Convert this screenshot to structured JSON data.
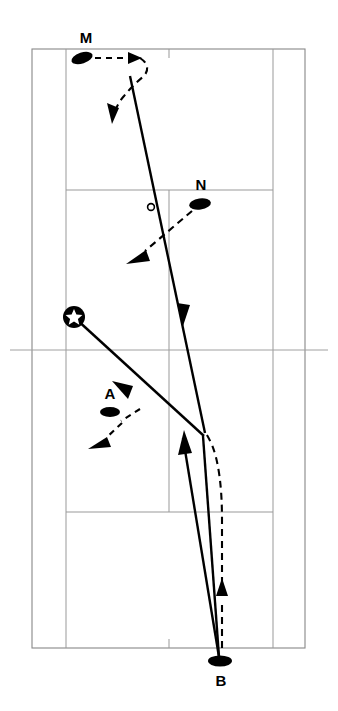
{
  "diagram": {
    "type": "tennis-court-play-diagram",
    "orientation": "vertical",
    "background_color": "#ffffff",
    "line_color": "#999999",
    "ink_color": "#000000",
    "court": {
      "outer_left_x": 32,
      "outer_right_x": 305,
      "singles_left_x": 66,
      "singles_right_x": 273,
      "top_baseline_y": 49,
      "bottom_baseline_y": 648,
      "net_y": 350,
      "top_service_line_y": 190,
      "bottom_service_line_y": 512,
      "center_x": 169,
      "net_extension_left_x": 10,
      "net_extension_right_x": 328
    },
    "players": [
      {
        "id": "M",
        "label": "M",
        "label_x": 86,
        "label_y": 43,
        "marker_x": 82,
        "marker_y": 58,
        "marker_rx": 11,
        "marker_ry": 5.5,
        "marker_rotation": -18
      },
      {
        "id": "N",
        "label": "N",
        "label_x": 201,
        "label_y": 190,
        "marker_x": 200,
        "marker_y": 204,
        "marker_rx": 11,
        "marker_ry": 5.5,
        "marker_rotation": -8
      },
      {
        "id": "A",
        "label": "A",
        "label_x": 110,
        "label_y": 399,
        "marker_x": 110,
        "marker_y": 412,
        "marker_rx": 10,
        "marker_ry": 5,
        "marker_rotation": 0
      },
      {
        "id": "B",
        "label": "B",
        "label_x": 221,
        "label_y": 686,
        "marker_x": 220,
        "marker_y": 661,
        "marker_rx": 12,
        "marker_ry": 5.5,
        "marker_rotation": 0
      }
    ],
    "server": {
      "name": "server-marker",
      "x": 74,
      "y": 317,
      "radius": 11,
      "inner_symbol": "star"
    },
    "bounce_marks": [
      {
        "name": "ball-bounce-mark",
        "x": 151,
        "y": 207,
        "radius": 3.4
      }
    ],
    "ball_paths": [
      {
        "name": "ball-path-m-outgoing",
        "style": "solid",
        "points": "130,75 205,432"
      },
      {
        "name": "ball-path-b-to-m",
        "style": "solid",
        "points": "219,658 181,447"
      },
      {
        "name": "ball-path-returning",
        "style": "solid",
        "points": "205,432 136,380 75,317"
      }
    ],
    "movement_paths": [
      {
        "name": "movement-path-m",
        "style": "dashed"
      },
      {
        "name": "movement-path-n",
        "style": "dashed"
      },
      {
        "name": "movement-path-a",
        "style": "dashed"
      },
      {
        "name": "movement-path-b",
        "style": "dashed"
      }
    ]
  }
}
